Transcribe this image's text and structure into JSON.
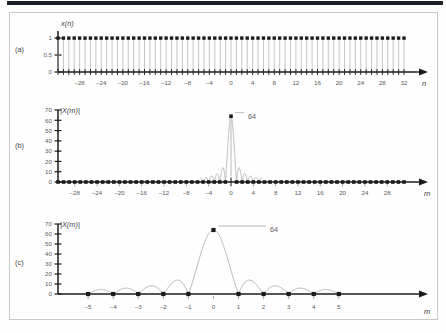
{
  "figure": {
    "title_bar": "",
    "panels": [
      {
        "id": "a",
        "panel_label": "(a)",
        "signal_label": "x(n)",
        "xaxis_label": "n",
        "yticks": [
          "0",
          "0.5",
          "1"
        ],
        "xticks": [
          "-28",
          "-24",
          "-20",
          "-16",
          "-12",
          "-8",
          "-4",
          "0",
          "4",
          "8",
          "12",
          "16",
          "20",
          "24",
          "28",
          "32"
        ]
      },
      {
        "id": "b",
        "panel_label": "(b)",
        "signal_label": "|X(m)|",
        "xaxis_label": "m",
        "peak_label": "64",
        "yticks": [
          "0",
          "10",
          "20",
          "30",
          "40",
          "50",
          "60",
          "70"
        ],
        "xticks": [
          "-28",
          "-24",
          "-20",
          "-16",
          "-12",
          "-8",
          "-4",
          "0",
          "4",
          "8",
          "12",
          "16",
          "20",
          "24",
          "28"
        ]
      },
      {
        "id": "c",
        "panel_label": "(c)",
        "signal_label": "|X(m)|",
        "xaxis_label": "m",
        "peak_label": "64",
        "yticks": [
          "0",
          "10",
          "20",
          "30",
          "40",
          "50",
          "60",
          "70"
        ],
        "xticks": [
          "-5",
          "-4",
          "-3",
          "-2",
          "-1",
          "0",
          "1",
          "2",
          "3",
          "4",
          "5"
        ]
      }
    ],
    "colors": {
      "marker": "#1b1b1b",
      "stem": "#b8b8b8",
      "curve": "#a8a8a8",
      "axis": "#1b1b1b",
      "tick_text": "#5b5b5b",
      "rule": "#1b2026",
      "frame": "#c9c9c9"
    }
  },
  "chart_data": [
    {
      "type": "bar",
      "id": "a",
      "title": "x(n)",
      "xlabel": "n",
      "ylabel": "x(n)",
      "xlim": [
        -32,
        32
      ],
      "ylim": [
        0,
        1.15
      ],
      "ytick_values": [
        0,
        0.5,
        1
      ],
      "xtick_values": [
        -28,
        -24,
        -20,
        -16,
        -12,
        -8,
        -4,
        0,
        4,
        8,
        12,
        16,
        20,
        24,
        28,
        32
      ],
      "grid": false,
      "legend": "none",
      "description": "Rectangular (all-ones) discrete time sequence; every sample from n=-32 to n=32 has amplitude 1.",
      "x": [
        -32,
        -31,
        -30,
        -29,
        -28,
        -27,
        -26,
        -25,
        -24,
        -23,
        -22,
        -21,
        -20,
        -19,
        -18,
        -17,
        -16,
        -15,
        -14,
        -13,
        -12,
        -11,
        -10,
        -9,
        -8,
        -7,
        -6,
        -5,
        -4,
        -3,
        -2,
        -1,
        0,
        1,
        2,
        3,
        4,
        5,
        6,
        7,
        8,
        9,
        10,
        11,
        12,
        13,
        14,
        15,
        16,
        17,
        18,
        19,
        20,
        21,
        22,
        23,
        24,
        25,
        26,
        27,
        28,
        29,
        30,
        31,
        32
      ],
      "values": [
        1,
        1,
        1,
        1,
        1,
        1,
        1,
        1,
        1,
        1,
        1,
        1,
        1,
        1,
        1,
        1,
        1,
        1,
        1,
        1,
        1,
        1,
        1,
        1,
        1,
        1,
        1,
        1,
        1,
        1,
        1,
        1,
        1,
        1,
        1,
        1,
        1,
        1,
        1,
        1,
        1,
        1,
        1,
        1,
        1,
        1,
        1,
        1,
        1,
        1,
        1,
        1,
        1,
        1,
        1,
        1,
        1,
        1,
        1,
        1,
        1,
        1,
        1,
        1,
        1
      ]
    },
    {
      "type": "bar",
      "id": "b",
      "title": "|X(m)|",
      "xlabel": "m",
      "ylabel": "|X(m)|",
      "xlim": [
        -31,
        31
      ],
      "ylim": [
        0,
        70
      ],
      "ytick_values": [
        0,
        10,
        20,
        30,
        40,
        50,
        60,
        70
      ],
      "xtick_values": [
        -28,
        -24,
        -20,
        -16,
        -12,
        -8,
        -4,
        0,
        4,
        8,
        12,
        16,
        20,
        24,
        28
      ],
      "grid": false,
      "legend": "none",
      "annotations": [
        {
          "text": "64",
          "x": 0,
          "y": 64
        }
      ],
      "description": "DFT magnitude of a 64-point all-ones sequence: a single spike of 64 at m=0 with near-zero sidelobes elsewhere.",
      "x": [
        -31,
        -30,
        -29,
        -28,
        -27,
        -26,
        -25,
        -24,
        -23,
        -22,
        -21,
        -20,
        -19,
        -18,
        -17,
        -16,
        -15,
        -14,
        -13,
        -12,
        -11,
        -10,
        -9,
        -8,
        -7,
        -6,
        -5,
        -4,
        -3,
        -2,
        -1,
        0,
        1,
        2,
        3,
        4,
        5,
        6,
        7,
        8,
        9,
        10,
        11,
        12,
        13,
        14,
        15,
        16,
        17,
        18,
        19,
        20,
        21,
        22,
        23,
        24,
        25,
        26,
        27,
        28,
        29,
        30,
        31
      ],
      "values": [
        0,
        0,
        0,
        0,
        0,
        0,
        0,
        0,
        0,
        0,
        0,
        0,
        0,
        0,
        0,
        0,
        0,
        0,
        0,
        0,
        0,
        0,
        0,
        0,
        0,
        0,
        0,
        0,
        0,
        0,
        0,
        64,
        0,
        0,
        0,
        0,
        0,
        0,
        0,
        0,
        0,
        0,
        0,
        0,
        0,
        0,
        0,
        0,
        0,
        0,
        0,
        0,
        0,
        0,
        0,
        0,
        0,
        0,
        0,
        0,
        0,
        0,
        0
      ],
      "envelope": {
        "description": "Continuous Dirichlet/sinc envelope through the DFT bins, visible between roughly m=-5 and m=+5",
        "sidelobe_peaks": [
          13.5,
          9.0,
          7.6,
          7.0,
          7.0,
          7.6,
          9.0,
          13.5
        ]
      }
    },
    {
      "type": "line",
      "id": "c",
      "title": "|X(m)|",
      "xlabel": "m",
      "ylabel": "|X(m)|",
      "xlim": [
        -6.2,
        7.6
      ],
      "ylim": [
        0,
        70
      ],
      "ytick_values": [
        0,
        10,
        20,
        30,
        40,
        50,
        60,
        70
      ],
      "xtick_values": [
        -5,
        -4,
        -3,
        -2,
        -1,
        0,
        1,
        2,
        3,
        4,
        5
      ],
      "grid": false,
      "legend": "none",
      "annotations": [
        {
          "text": "64",
          "x": 0,
          "y": 64
        }
      ],
      "description": "Zoomed view of |X(m)| showing the sinc envelope: main lobe of 64 at m=0, zeros at every nonzero integer m, sidelobe humps of roughly 14, 9, 8 and 7 between integers.",
      "x": [
        -5,
        -4,
        -3,
        -2,
        -1,
        0,
        1,
        2,
        3,
        4,
        5
      ],
      "values": [
        0,
        0,
        0,
        0,
        0,
        64,
        0,
        0,
        0,
        0,
        0
      ],
      "envelope_peaks": {
        "x": [
          -4.5,
          -3.5,
          -2.5,
          -1.5,
          1.5,
          2.5,
          3.5,
          4.5
        ],
        "values": [
          7.2,
          7.8,
          9.2,
          14.0,
          14.0,
          9.2,
          7.8,
          7.2
        ]
      }
    }
  ]
}
